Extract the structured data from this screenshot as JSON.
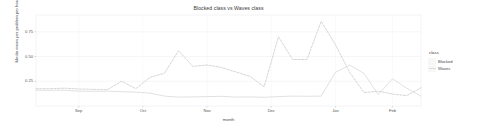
{
  "chart_data": {
    "type": "line",
    "title": "Blocked class vs Waves class",
    "xlabel": "month",
    "ylabel": "Media errors per problem per hour",
    "grid": true,
    "legend_position": "right",
    "legend_title": "class",
    "xlim": [
      0,
      27
    ],
    "ylim": [
      0.0,
      0.92
    ],
    "ytick_values": [
      0.25,
      0.5,
      0.75
    ],
    "ytick_labels": [
      "0.25",
      "0.50",
      "0.75"
    ],
    "xtick_positions": [
      3,
      7.5,
      12,
      16.5,
      21,
      25
    ],
    "xtick_labels": [
      "Sep",
      "Oct",
      "Nov",
      "Dec",
      "Jan",
      "Feb"
    ],
    "x": [
      0,
      1,
      2,
      3,
      4,
      5,
      6,
      7,
      8,
      9,
      10,
      11,
      12,
      13,
      14,
      15,
      16,
      17,
      18,
      19,
      20,
      21,
      22,
      23,
      24,
      25,
      26,
      27
    ],
    "series": [
      {
        "name": "Blocked",
        "color": "#cfcfcf",
        "dash": "dashed",
        "values": [
          0.175,
          0.175,
          0.18,
          0.172,
          0.168,
          0.165,
          0.25,
          0.175,
          0.29,
          0.33,
          0.56,
          0.4,
          0.415,
          0.39,
          0.345,
          0.3,
          0.195,
          0.7,
          0.47,
          0.47,
          0.855,
          0.62,
          0.34,
          0.135,
          0.15,
          0.12,
          0.105,
          0.185
        ]
      },
      {
        "name": "Waves",
        "color": "#dcdcdc",
        "dash": "solid",
        "values": [
          0.16,
          0.158,
          0.16,
          0.15,
          0.148,
          0.15,
          0.145,
          0.14,
          0.13,
          0.1,
          0.09,
          0.092,
          0.095,
          0.098,
          0.09,
          0.092,
          0.088,
          0.095,
          0.1,
          0.098,
          0.1,
          0.34,
          0.415,
          0.33,
          0.115,
          0.275,
          0.18,
          0.1
        ]
      }
    ]
  }
}
